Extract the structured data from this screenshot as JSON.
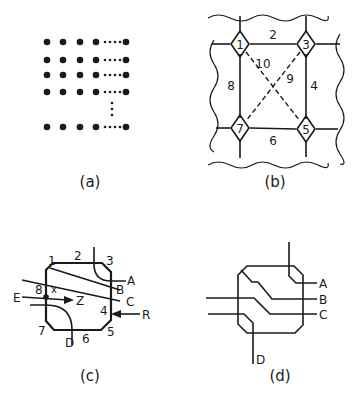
{
  "figure": {
    "panels": [
      {
        "id": "a",
        "caption": "(a)",
        "description": "grid array of dots with ellipses indicating continuation",
        "rows_shown": 5,
        "cols_shown": 5
      },
      {
        "id": "b",
        "caption": "(b)",
        "node_labels": [
          "1",
          "3",
          "5",
          "7"
        ],
        "edge_labels": [
          "2",
          "4",
          "6",
          "8"
        ],
        "diagonal_labels": [
          "9",
          "10"
        ]
      },
      {
        "id": "c",
        "caption": "(c)",
        "corner_labels": [
          "1",
          "3",
          "5",
          "7"
        ],
        "side_labels": [
          "2",
          "4",
          "6",
          "8"
        ],
        "terminal_labels": [
          "A",
          "B",
          "C",
          "D",
          "E",
          "R",
          "Z"
        ],
        "point_label": "x"
      },
      {
        "id": "d",
        "caption": "(d)",
        "terminal_labels": [
          "A",
          "B",
          "C",
          "D"
        ]
      }
    ]
  }
}
